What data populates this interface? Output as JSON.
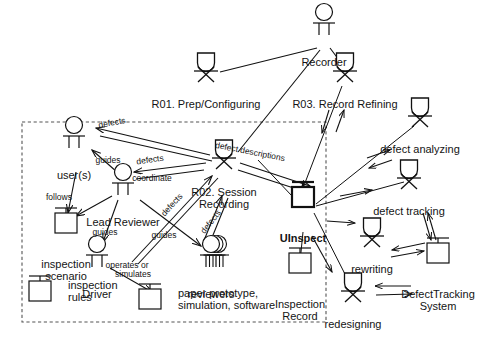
{
  "diagram": {
    "type": "use-case-role-activity",
    "title": "",
    "boundary": {
      "style": "dashed",
      "x": 22,
      "y": 122,
      "w": 304,
      "h": 200
    },
    "actors": [
      {
        "id": "recorder",
        "label": "Recorder",
        "shape": "human-actor",
        "x": 324,
        "y": 20,
        "label_x": 324,
        "label_y": 56
      },
      {
        "id": "users",
        "label": "user(s)",
        "shape": "human-actor",
        "x": 74,
        "y": 133,
        "label_x": 74,
        "label_y": 169
      },
      {
        "id": "lead-reviewer",
        "label": "Lead Reviewer",
        "shape": "human-actor",
        "x": 123,
        "y": 180,
        "label_x": 123,
        "label_y": 216
      },
      {
        "id": "driver",
        "label": "Driver",
        "shape": "human-actor",
        "x": 97,
        "y": 252,
        "label_x": 97,
        "label_y": 288
      },
      {
        "id": "reviewers",
        "label": "reviewers",
        "shape": "human-actor-multi",
        "x": 211,
        "y": 252,
        "label_x": 211,
        "label_y": 288
      }
    ],
    "tasks": [
      {
        "id": "r01",
        "label": "R01. Prep/Configuring",
        "shape": "task",
        "x": 206,
        "y": 68,
        "label_x": 206,
        "label_y": 98
      },
      {
        "id": "r03",
        "label": "R03. Record Refining",
        "shape": "task",
        "x": 345,
        "y": 68,
        "label_x": 345,
        "label_y": 98
      },
      {
        "id": "r02",
        "label": "R02. Session Recording",
        "shape": "task",
        "x": 224,
        "y": 155,
        "label_x": 224,
        "label_y": 186,
        "wrap": true,
        "wrap_w": 78
      },
      {
        "id": "defect-analyzing",
        "label": "defect analyzing",
        "shape": "task",
        "x": 420,
        "y": 113,
        "label_x": 420,
        "label_y": 143
      },
      {
        "id": "defect-tracking",
        "label": "defect tracking",
        "shape": "task",
        "x": 409,
        "y": 175,
        "label_x": 409,
        "label_y": 205
      },
      {
        "id": "rewriting",
        "label": "rewriting",
        "shape": "task",
        "x": 372,
        "y": 233,
        "label_x": 372,
        "label_y": 263
      },
      {
        "id": "redesigning",
        "label": "redesigning",
        "shape": "task",
        "x": 353,
        "y": 288,
        "label_x": 353,
        "label_y": 318
      }
    ],
    "artifacts": [
      {
        "id": "inspection-scenario",
        "label": "inspection\nscenario",
        "shape": "artifact",
        "x": 66,
        "y": 222,
        "label_x": 66,
        "label_y": 258,
        "bold": false,
        "label_pos": "below"
      },
      {
        "id": "inspection-rules",
        "label": "inspection\nrules",
        "shape": "artifact",
        "x": 40,
        "y": 290,
        "label_x": 68,
        "label_y": 290,
        "bold": false,
        "label_pos": "right"
      },
      {
        "id": "paper-prototype",
        "label": "paper prototype,\nsimulation, software",
        "shape": "artifact",
        "x": 150,
        "y": 298,
        "label_x": 178,
        "label_y": 298,
        "bold": false,
        "label_pos": "right"
      },
      {
        "id": "uinspect",
        "label": "UInspect",
        "shape": "artifact-bold",
        "x": 303,
        "y": 196,
        "label_x": 303,
        "label_y": 232,
        "bold": true,
        "label_pos": "below"
      },
      {
        "id": "inspection-record",
        "label": "Inspection\nRecord",
        "shape": "artifact",
        "x": 300,
        "y": 262,
        "label_x": 300,
        "label_y": 298,
        "bold": false,
        "label_pos": "below"
      },
      {
        "id": "defecttracking-system",
        "label": "DefectTracking\nSystem",
        "shape": "artifact",
        "x": 438,
        "y": 252,
        "label_x": 438,
        "label_y": 288,
        "bold": false,
        "label_pos": "below"
      }
    ],
    "edge_labels": [
      {
        "id": "defects-1",
        "text": "defects",
        "x": 112,
        "y": 123,
        "rotate": -11
      },
      {
        "id": "guides-1",
        "text": "guides",
        "x": 108,
        "y": 160,
        "rotate": 0
      },
      {
        "id": "defects-2",
        "text": "defects",
        "x": 150,
        "y": 160,
        "rotate": -8
      },
      {
        "id": "coordinate",
        "text": "coordinate",
        "x": 152,
        "y": 178,
        "rotate": 0
      },
      {
        "id": "follows",
        "text": "follows",
        "x": 59,
        "y": 197,
        "rotate": 0
      },
      {
        "id": "defects-3",
        "text": "defects",
        "x": 172,
        "y": 205,
        "rotate": -48
      },
      {
        "id": "defect-descriptions",
        "text": "defect descriptions",
        "x": 250,
        "y": 152,
        "rotate": 11
      },
      {
        "id": "guides-2",
        "text": "guides",
        "x": 105,
        "y": 232,
        "rotate": 0
      },
      {
        "id": "guides-3",
        "text": "guides",
        "x": 164,
        "y": 235,
        "rotate": 0
      },
      {
        "id": "defects-4",
        "text": "defects",
        "x": 211,
        "y": 222,
        "rotate": -52
      },
      {
        "id": "operates-or",
        "text": "operates or",
        "x": 127,
        "y": 265,
        "rotate": 0
      },
      {
        "id": "simulates",
        "text": "simulates",
        "x": 133,
        "y": 274,
        "rotate": 0
      }
    ]
  }
}
